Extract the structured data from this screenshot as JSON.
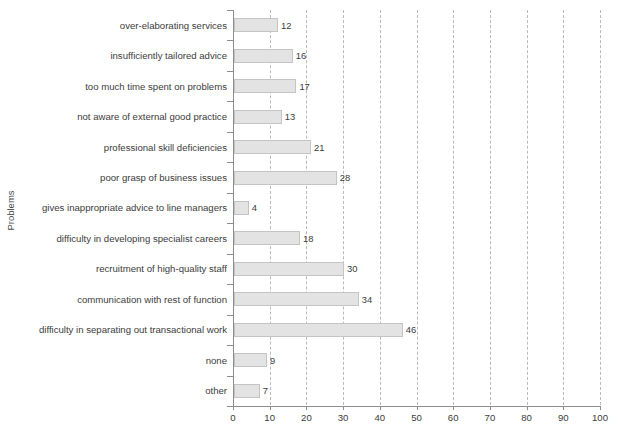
{
  "chart_data": {
    "type": "bar",
    "orientation": "horizontal",
    "title": "",
    "xlabel": "",
    "ylabel": "Problems",
    "xlim": [
      0,
      100
    ],
    "ylim": null,
    "grid": true,
    "grid_axis": "x",
    "legend": null,
    "xticks": [
      0,
      10,
      20,
      30,
      40,
      50,
      60,
      70,
      80,
      90,
      100
    ],
    "xtick_labels": [
      "0",
      "10",
      "20",
      "30",
      "40",
      "50",
      "60",
      "70",
      "80",
      "90",
      "100"
    ],
    "categories": [
      "over-elaborating services",
      "insufficiently tailored advice",
      "too much time spent on problems",
      "not aware of external good practice",
      "professional skill deficiencies",
      "poor grasp of business issues",
      "gives inappropriate advice to line managers",
      "difficulty in developing specialist careers",
      "recruitment of high-quality staff",
      "communication with rest of function",
      "difficulty in separating out transactional work",
      "none",
      "other"
    ],
    "values": [
      12,
      16,
      17,
      13,
      21,
      28,
      4,
      18,
      30,
      34,
      46,
      9,
      7
    ],
    "value_labels": [
      "12",
      "16",
      "17",
      "13",
      "21",
      "28",
      "4",
      "18",
      "30",
      "34",
      "46",
      "9",
      "7"
    ],
    "colors": {
      "bar_fill": "#e3e3e3",
      "bar_edge": "#c4c4c4",
      "gridline": "#b9b9b9",
      "axis": "#8d8d8d",
      "text": "#3c3c3c",
      "background": "#ffffff"
    }
  }
}
